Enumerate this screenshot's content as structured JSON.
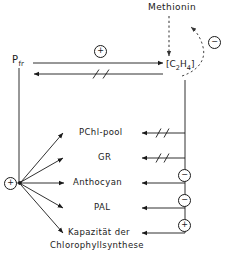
{
  "diagram": {
    "nodes": {
      "methionin": "Methionin",
      "pfr": "P",
      "pfr_sub": "fr",
      "ethylene_open": "[",
      "ethylene_c": "C",
      "ethylene_2": "2",
      "ethylene_h": "H",
      "ethylene_4": "4",
      "ethylene_close": "]"
    },
    "targets": [
      {
        "label": "PChl-pool",
        "effect": "blocked",
        "effect_symbol": "//"
      },
      {
        "label": "GR",
        "effect": "blocked",
        "effect_symbol": "//"
      },
      {
        "label": "Anthocyan",
        "effect": "negative",
        "effect_symbol": "⊖"
      },
      {
        "label": "PAL",
        "effect": "negative",
        "effect_symbol": "⊖"
      },
      {
        "label": "Kapazität der",
        "label_line2": "Chlorophyllsynthese",
        "effect": "positive",
        "effect_symbol": "⊕"
      }
    ],
    "signs": {
      "pfr_to_ethylene": "+",
      "methionin_inhibition": "−",
      "anthocyan": "−",
      "pal": "−",
      "kapazitaet": "+",
      "pfr_hub": "+"
    },
    "edges": {
      "pfr_to_ethylene_label": "+",
      "ethylene_to_pfr_interrupt": "//",
      "methionin_to_ethylene": "dashed-arrow-down",
      "feedback_inhibition": "dashed-curved-arrow"
    },
    "colors": {
      "line": "#1a1a1a",
      "background": "#ffffff",
      "dashed": "#555555"
    }
  }
}
